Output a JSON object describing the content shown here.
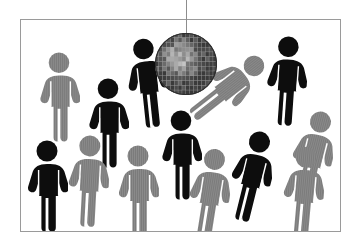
{
  "image": {
    "title": "Crowd of people silhouettes dancing under a disco ball",
    "kind": "clip-art-illustration",
    "width": 362,
    "height": 248,
    "background_color": "#ffffff"
  },
  "frame": {
    "name": "picture-frame",
    "border_color": "#9a9a9a",
    "border_width": 1,
    "x": 20,
    "y": 19,
    "width": 321,
    "height": 213,
    "fill": "#ffffff"
  },
  "palette": {
    "dark_figure": "#0d0d0d",
    "light_figure": "#8a8a8a",
    "light_figure_stripe": "#7b7b7b",
    "ball_light": "#e8e8e8",
    "ball_mid": "#a8a8a8",
    "ball_dark": "#4f4f4f",
    "ball_edge": "#2e2e2e",
    "wire": "#8d8d8d",
    "background": "#ffffff"
  },
  "disco_ball": {
    "name": "disco-ball",
    "center_x": 186,
    "center_y": 64,
    "radius": 31,
    "wire_x": 186,
    "wire_top_y": 0,
    "wire_bottom_y": 33,
    "facet_rows": 13,
    "facet_cols": 16,
    "highlight_x": 172,
    "highlight_y": 52
  },
  "figures": [
    {
      "id": "fig-01",
      "tone": "light",
      "x": 38,
      "y": 52,
      "w": 42,
      "h": 90,
      "rotation": 0,
      "pose": "standing",
      "zone": "upper-left"
    },
    {
      "id": "fig-02",
      "tone": "dark",
      "x": 87,
      "y": 78,
      "w": 42,
      "h": 90,
      "rotation": 0,
      "pose": "standing",
      "zone": "upper-left-center"
    },
    {
      "id": "fig-03",
      "tone": "dark",
      "x": 126,
      "y": 38,
      "w": 42,
      "h": 90,
      "rotation": -6,
      "pose": "standing",
      "zone": "near-ball-left"
    },
    {
      "id": "fig-04",
      "tone": "light",
      "x": 206,
      "y": 42,
      "w": 42,
      "h": 90,
      "rotation": 52,
      "pose": "leaning",
      "zone": "near-ball-right"
    },
    {
      "id": "fig-05",
      "tone": "dark",
      "x": 265,
      "y": 36,
      "w": 42,
      "h": 90,
      "rotation": 4,
      "pose": "standing",
      "zone": "upper-right"
    },
    {
      "id": "fig-06",
      "tone": "dark",
      "x": 160,
      "y": 110,
      "w": 42,
      "h": 90,
      "rotation": 0,
      "pose": "standing",
      "zone": "center"
    },
    {
      "id": "fig-07",
      "tone": "light",
      "x": 291,
      "y": 108,
      "w": 42,
      "h": 96,
      "rotation": 14,
      "pose": "standing",
      "zone": "right"
    },
    {
      "id": "fig-08",
      "tone": "dark",
      "x": 26,
      "y": 140,
      "w": 42,
      "h": 92,
      "rotation": 0,
      "pose": "standing",
      "zone": "lower-left"
    },
    {
      "id": "fig-09",
      "tone": "light",
      "x": 67,
      "y": 133,
      "w": 42,
      "h": 96,
      "rotation": 3,
      "pose": "standing",
      "zone": "lower-left-center"
    },
    {
      "id": "fig-10",
      "tone": "light",
      "x": 117,
      "y": 145,
      "w": 42,
      "h": 92,
      "rotation": 0,
      "pose": "standing",
      "zone": "lower-center-left"
    },
    {
      "id": "fig-11",
      "tone": "light",
      "x": 188,
      "y": 148,
      "w": 42,
      "h": 92,
      "rotation": 9,
      "pose": "standing",
      "zone": "lower-center-right"
    },
    {
      "id": "fig-12",
      "tone": "dark",
      "x": 230,
      "y": 128,
      "w": 42,
      "h": 96,
      "rotation": 14,
      "pose": "leaning",
      "zone": "lower-right-center"
    },
    {
      "id": "fig-13",
      "tone": "light",
      "x": 282,
      "y": 146,
      "w": 42,
      "h": 92,
      "rotation": 5,
      "pose": "standing",
      "zone": "lower-right"
    }
  ],
  "counts": {
    "total_figures": 13,
    "dark_figures": 6,
    "light_figures": 7
  }
}
